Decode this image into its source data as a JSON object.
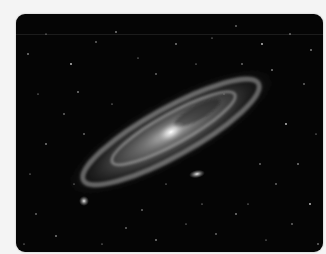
{
  "image": {
    "subject": "Andromeda galaxy",
    "alt": "Grayscale photograph of a large spiral galaxy seen at an oblique angle against a star field, with two small satellite galaxies",
    "colors": {
      "page_background": "#f4f4f4",
      "sky": "#050505",
      "galaxy_glow": "#bdbdbd",
      "core": "#f2f2f2"
    }
  }
}
